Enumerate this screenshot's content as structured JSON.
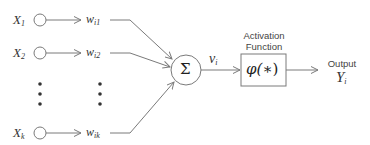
{
  "diagram": {
    "colors": {
      "stroke": "#7a7a7a",
      "text": "#333333",
      "background": "#ffffff"
    },
    "inputs": [
      {
        "label": "X",
        "sub": "1",
        "weight": "w",
        "weight_sub": "i1"
      },
      {
        "label": "X",
        "sub": "2",
        "weight": "w",
        "weight_sub": "i2"
      },
      {
        "label": "X",
        "sub": "k",
        "weight": "w",
        "weight_sub": "ik"
      }
    ],
    "ellipsis": "⋮",
    "summation": {
      "symbol": "Σ"
    },
    "net_input": {
      "label": "v",
      "sub": "i"
    },
    "activation": {
      "caption_line1": "Activation",
      "caption_line2": "Function",
      "formula_left": "φ(",
      "formula_mid": "∗",
      "formula_right": ")"
    },
    "output": {
      "caption": "Output",
      "label": "Y",
      "sub": "i"
    }
  }
}
